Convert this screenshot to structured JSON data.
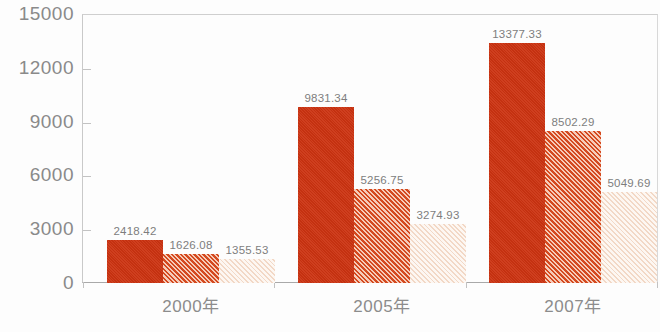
{
  "chart_data": {
    "type": "bar",
    "title": "",
    "xlabel": "",
    "ylabel": "",
    "categories": [
      "2000年",
      "2005年",
      "2007年"
    ],
    "series": [
      {
        "name": "series-1",
        "color": "#cc3311",
        "pattern": "solid",
        "values": [
          2418.42,
          1626.08,
          1355.53
        ]
      },
      {
        "name": "series-2",
        "color": "#d4491f",
        "pattern": "diagonal-hatch",
        "values": [
          9831.34,
          5256.75,
          3274.93
        ]
      },
      {
        "name": "series-3",
        "color": "#f2d8c6",
        "pattern": "light-diagonal-hatch",
        "values": [
          13377.33,
          8502.29,
          5049.69
        ]
      }
    ],
    "groups": [
      {
        "category": "2000年",
        "values": [
          2418.42,
          1626.08,
          1355.53
        ],
        "labels": [
          "2418.42",
          "1626.08",
          "1355.53"
        ]
      },
      {
        "category": "2005年",
        "values": [
          9831.34,
          5256.75,
          3274.93
        ],
        "labels": [
          "9831.34",
          "5256.75",
          "3274.93"
        ]
      },
      {
        "category": "2007年",
        "values": [
          13377.33,
          8502.29,
          5049.69
        ],
        "labels": [
          "13377.33",
          "8502.29",
          "5049.69"
        ]
      }
    ],
    "yticks": [
      0,
      3000,
      6000,
      9000,
      12000,
      15000
    ],
    "ytick_labels": [
      "0",
      "3000",
      "6000",
      "9000",
      "12000",
      "15000"
    ],
    "ylim": [
      0,
      15000
    ],
    "grid": false,
    "legend": "none",
    "axis_color": "#c2c2c2",
    "label_color": "#7d7d7d",
    "background": "#fdfdfd"
  }
}
